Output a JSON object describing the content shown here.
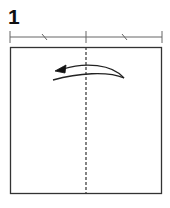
{
  "step": {
    "number": "1"
  },
  "diagram": {
    "fold_line": "valley fold (dashed) along vertical center line",
    "arrow": "curved fold arrow pointing left from right half to left half",
    "measure_bar": "two equal halves marked with tick slashes",
    "colors": {
      "line": "#333333",
      "paper": "#ffffff"
    }
  }
}
